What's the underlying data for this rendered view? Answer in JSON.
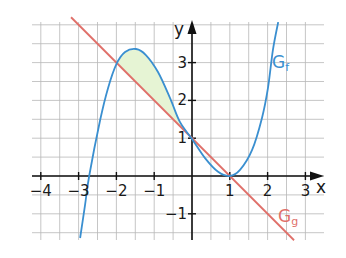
{
  "chart_data": {
    "type": "line",
    "title": "",
    "xlabel": "x",
    "ylabel": "y",
    "xlim": [
      -4.2,
      3.5
    ],
    "ylim": [
      -1.7,
      4.2
    ],
    "grid": true,
    "grid_step": 0.5,
    "x_ticks": [
      -4,
      -3,
      -2,
      -1,
      1,
      2,
      3
    ],
    "x_tick_labels": [
      "−4",
      "−3",
      "−2",
      "−1",
      "1",
      "2",
      "3"
    ],
    "y_ticks": [
      -1,
      1,
      2,
      3
    ],
    "y_tick_labels": [
      "−1",
      "1",
      "2",
      "3"
    ],
    "series": [
      {
        "name": "G_f",
        "label": "G",
        "subscript": "f",
        "color": "#3a8fd0",
        "x": [
          -2.96,
          -2.83,
          -2.72,
          -2.43,
          -2.22,
          -2.0,
          -1.77,
          -1.48,
          -1.22,
          -0.9,
          -0.58,
          -0.32,
          0.0,
          0.34,
          0.69,
          1.0,
          1.27,
          1.59,
          1.85,
          2.01,
          2.14,
          2.28
        ],
        "y": [
          -1.64,
          -0.77,
          0.0,
          1.48,
          2.33,
          2.96,
          3.28,
          3.36,
          3.2,
          2.75,
          2.06,
          1.43,
          0.98,
          0.48,
          0.11,
          0.0,
          0.16,
          0.69,
          1.53,
          2.33,
          3.33,
          4.07
        ]
      },
      {
        "name": "G_g",
        "label": "G",
        "subscript": "g",
        "color": "#e0706a",
        "x": [
          -3.2,
          2.7
        ],
        "y": [
          4.2,
          -1.7
        ]
      }
    ],
    "shaded_region": {
      "between": [
        "G_f",
        "G_g"
      ],
      "x_range": [
        -2,
        0
      ],
      "color": "#e6f4d4"
    },
    "annotations": [
      {
        "text": "G_f",
        "x": 2.4,
        "y": 3.0
      },
      {
        "text": "G_g",
        "x": 2.5,
        "y": -1.1
      }
    ]
  }
}
